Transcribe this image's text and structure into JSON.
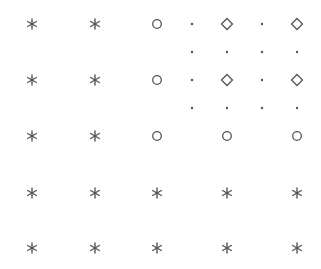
{
  "diagram": {
    "title": "",
    "marker_color": "#555555",
    "marker_types": {
      "asterisk": "asterisk-marker",
      "circle": "circle-marker",
      "diamond": "diamond-marker",
      "dot": "dot-marker"
    },
    "columns": 7,
    "rows": 7,
    "grid": [
      [
        "asterisk",
        "asterisk",
        "circle",
        "dot",
        "diamond",
        "dot",
        "diamond"
      ],
      [
        null,
        null,
        null,
        "dot",
        "dot",
        "dot",
        "dot"
      ],
      [
        "asterisk",
        "asterisk",
        "circle",
        "dot",
        "diamond",
        "dot",
        "diamond"
      ],
      [
        null,
        null,
        null,
        "dot",
        "dot",
        "dot",
        "dot"
      ],
      [
        "asterisk",
        "asterisk",
        "circle",
        null,
        "circle",
        null,
        "circle"
      ],
      [
        "asterisk",
        "asterisk",
        "asterisk",
        null,
        "asterisk",
        null,
        "asterisk"
      ],
      [
        "asterisk",
        "asterisk",
        "asterisk",
        null,
        "asterisk",
        null,
        "asterisk"
      ]
    ]
  }
}
